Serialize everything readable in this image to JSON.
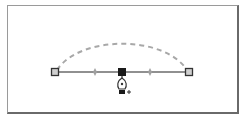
{
  "diagram": {
    "colors": {
      "frame_light": "#9a9a9a",
      "frame_dark": "#6a6a6a",
      "path": "#6b6b6b",
      "dashed_curve": "#a8a8a8",
      "anchor_fill": "#cfcfcf",
      "anchor_stroke": "#333333",
      "selected_anchor": "#1a1a1a",
      "midpoint": "#9a9a9a"
    },
    "path": {
      "start": {
        "x": 55,
        "y": 72
      },
      "end": {
        "x": 189,
        "y": 72
      }
    },
    "anchors": [
      {
        "name": "left-anchor",
        "x": 55,
        "y": 72,
        "selected": false
      },
      {
        "name": "middle-anchor",
        "x": 122,
        "y": 72,
        "selected": true
      },
      {
        "name": "right-anchor",
        "x": 189,
        "y": 72,
        "selected": false
      }
    ],
    "midpoints": [
      {
        "x": 95,
        "y": 72
      },
      {
        "x": 150,
        "y": 72
      }
    ],
    "dashed_curve": {
      "start": {
        "x": 57,
        "y": 70
      },
      "peak": {
        "x": 122,
        "y": 38
      },
      "end": {
        "x": 187,
        "y": 70
      }
    },
    "cursor": {
      "tool": "pen-add-anchor",
      "x": 122,
      "y": 80,
      "modifier_symbol": "+"
    }
  }
}
